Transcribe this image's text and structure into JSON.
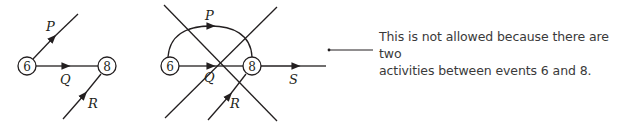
{
  "colors": {
    "ink": "#231f20",
    "text": "#3a3a3a",
    "background": "#ffffff"
  },
  "left_diagram": {
    "nodes": [
      {
        "id": "6",
        "label": "6"
      },
      {
        "id": "8",
        "label": "8"
      }
    ],
    "activities": [
      {
        "label": "P",
        "from": "6",
        "to": "open"
      },
      {
        "label": "Q",
        "from": "6",
        "to": "8"
      },
      {
        "label": "R",
        "from": "open",
        "to": "8"
      }
    ]
  },
  "right_diagram": {
    "nodes": [
      {
        "id": "6",
        "label": "6"
      },
      {
        "id": "8",
        "label": "8"
      }
    ],
    "activities": [
      {
        "label": "P",
        "from": "6",
        "to": "8",
        "shape": "arc"
      },
      {
        "label": "Q",
        "from": "6",
        "to": "8"
      },
      {
        "label": "R",
        "from": "open",
        "to": "8"
      },
      {
        "label": "S",
        "from": "8",
        "to": "open"
      }
    ],
    "crossed_out": true
  },
  "annotation": {
    "line1": "This is not allowed because there are two",
    "line2": "activities between events 6 and 8."
  }
}
